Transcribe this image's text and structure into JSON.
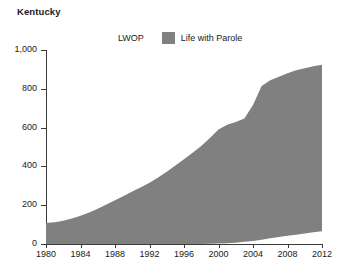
{
  "chart_data": {
    "type": "area",
    "stacked": true,
    "title": "Kentucky",
    "xlabel": "",
    "ylabel": "",
    "xlim": [
      1980,
      2012
    ],
    "ylim": [
      0,
      1000
    ],
    "grid": false,
    "legend_position": "top-center",
    "x_ticks": [
      1980,
      1984,
      1988,
      1992,
      1996,
      2000,
      2004,
      2008,
      2012
    ],
    "x_tick_labels": [
      "1980",
      "1984",
      "1988",
      "1992",
      "1996",
      "2000",
      "2004",
      "2008",
      "2012"
    ],
    "y_ticks": [
      0,
      200,
      400,
      600,
      800,
      1000
    ],
    "y_tick_labels": [
      "0",
      "200",
      "400",
      "600",
      "800",
      "1,000"
    ],
    "colors": {
      "life_with_parole": "#808080",
      "lwop": "#ffffff",
      "axis": "#3a3a3a",
      "text": "#1a1a1a"
    },
    "x": [
      1980,
      1981,
      1982,
      1983,
      1984,
      1985,
      1986,
      1987,
      1988,
      1989,
      1990,
      1991,
      1992,
      1993,
      1994,
      1995,
      1996,
      1997,
      1998,
      1999,
      2000,
      2001,
      2002,
      2003,
      2004,
      2005,
      2006,
      2007,
      2008,
      2009,
      2010,
      2011,
      2012
    ],
    "series": [
      {
        "name": "Life with Parole",
        "color": "#808080",
        "values": [
          108,
          112,
          120,
          132,
          146,
          163,
          182,
          203,
          226,
          248,
          270,
          292,
          316,
          343,
          372,
          404,
          437,
          470,
          505,
          545,
          588,
          611,
          622,
          636,
          700,
          792,
          815,
          826,
          838,
          848,
          852,
          856,
          858
        ]
      },
      {
        "name": "LWOP",
        "color": "#ffffff",
        "values": [
          0,
          0,
          0,
          0,
          0,
          0,
          0,
          0,
          0,
          0,
          0,
          0,
          0,
          0,
          0,
          0,
          0,
          0,
          0,
          1,
          2,
          4,
          7,
          11,
          16,
          22,
          29,
          36,
          42,
          48,
          54,
          60,
          66
        ]
      }
    ],
    "totals": [
      108,
      112,
      120,
      132,
      146,
      163,
      182,
      203,
      226,
      248,
      270,
      292,
      316,
      343,
      372,
      404,
      437,
      470,
      505,
      546,
      590,
      615,
      629,
      647,
      716,
      814,
      844,
      862,
      880,
      896,
      906,
      916,
      924
    ]
  },
  "legend": {
    "entries": [
      {
        "label": "LWOP",
        "swatch": "none"
      },
      {
        "label": "Life with Parole",
        "swatch": "#808080"
      }
    ]
  }
}
